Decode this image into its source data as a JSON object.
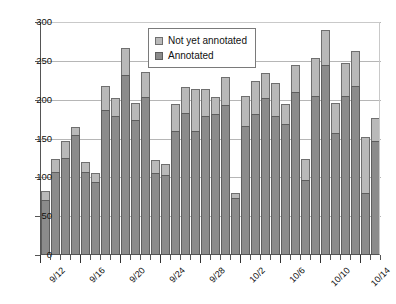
{
  "chart_data": {
    "type": "bar",
    "subtype": "stacked",
    "title": "",
    "xlabel": "",
    "ylabel": "",
    "ylim": [
      0,
      300
    ],
    "ytick_values": [
      0,
      50,
      100,
      150,
      200,
      250,
      300
    ],
    "ytick_labels": [
      "0",
      "50",
      "100",
      "150",
      "200",
      "250",
      "300"
    ],
    "grid": true,
    "legend_position": "top-center",
    "categories": [
      "9/12",
      "9/13",
      "9/14",
      "9/15",
      "9/16",
      "9/17",
      "9/18",
      "9/19",
      "9/20",
      "9/21",
      "9/22",
      "9/23",
      "9/24",
      "9/25",
      "9/26",
      "9/27",
      "9/28",
      "9/29",
      "9/30",
      "10/1",
      "10/2",
      "10/3",
      "10/4",
      "10/5",
      "10/6",
      "10/7",
      "10/8",
      "10/9",
      "10/10",
      "10/11",
      "10/12",
      "10/13",
      "10/14",
      "10/15"
    ],
    "xtick_labels": [
      "9/12",
      "9/16",
      "9/20",
      "9/24",
      "9/28",
      "10/2",
      "10/6",
      "10/10",
      "10/14"
    ],
    "xtick_label_indices": [
      0,
      4,
      8,
      12,
      16,
      20,
      24,
      28,
      32
    ],
    "series": [
      {
        "name": "Annotated",
        "color": "#8b8b8b",
        "values": [
          69,
          106,
          123,
          153,
          105,
          93,
          186,
          178,
          230,
          173,
          202,
          104,
          102,
          158,
          182,
          159,
          178,
          180,
          192,
          72,
          165,
          180,
          201,
          178,
          168,
          208,
          95,
          204,
          243,
          156,
          204,
          216,
          78,
          146
        ]
      },
      {
        "name": "Not yet annotated",
        "color": "#b9b9b9",
        "values": [
          12,
          16,
          23,
          11,
          14,
          11,
          30,
          23,
          35,
          21,
          32,
          17,
          14,
          35,
          33,
          53,
          34,
          22,
          36,
          7,
          39,
          43,
          32,
          42,
          25,
          35,
          27,
          48,
          46,
          39,
          42,
          46,
          73,
          29
        ]
      }
    ],
    "totals": [
      81,
      122,
      146,
      164,
      119,
      104,
      216,
      201,
      265,
      194,
      234,
      121,
      116,
      193,
      215,
      212,
      212,
      202,
      228,
      79,
      204,
      223,
      233,
      220,
      193,
      243,
      122,
      252,
      289,
      195,
      246,
      262,
      151,
      175
    ]
  },
  "legend": {
    "items": [
      {
        "label": "Not yet annotated",
        "swatch": "light-gray-swatch-icon"
      },
      {
        "label": "Annotated",
        "swatch": "dark-gray-swatch-icon"
      }
    ]
  }
}
